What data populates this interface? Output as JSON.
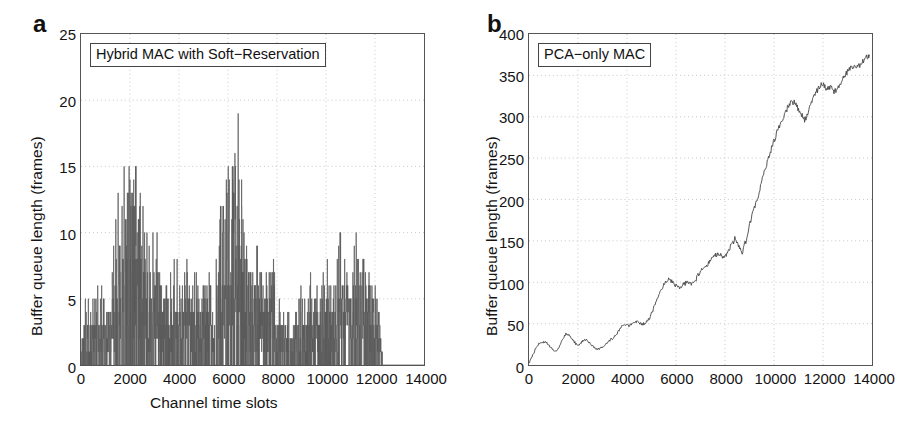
{
  "figure": {
    "panels": [
      {
        "letter": "a",
        "legend": "Hybrid MAC with Soft−Reservation",
        "xlabel": "Channel time slots",
        "ylabel": "Buffer queue length (frames)"
      },
      {
        "letter": "b",
        "legend": "PCA−only MAC",
        "xlabel": "Channel time slots",
        "ylabel": "Buffer queue length (frames)"
      }
    ]
  },
  "chart_data": [
    {
      "type": "line",
      "title": "",
      "legend_label": "Hybrid MAC with Soft−Reservation",
      "legend_position": "top-left",
      "xlabel": "Channel time slots",
      "ylabel": "Buffer queue length (frames)",
      "xlim": [
        0,
        14000
      ],
      "ylim": [
        0,
        25
      ],
      "xticks": [
        0,
        2000,
        4000,
        6000,
        8000,
        10000,
        12000,
        14000
      ],
      "yticks": [
        0,
        5,
        10,
        15,
        20,
        25
      ],
      "grid": true,
      "grid_style": "dotted",
      "line_color": "#5a5a5a",
      "description": "Dense high-frequency spiky queue-length trace that stays bounded; bursts of activity between 0 and about 12300 slots, then flat/no data.",
      "envelope_x": [
        0,
        200,
        400,
        600,
        800,
        1000,
        1200,
        1400,
        1600,
        1800,
        2000,
        2200,
        2400,
        2600,
        2800,
        3000,
        3200,
        3400,
        3600,
        3800,
        4000,
        4200,
        4400,
        4600,
        4800,
        5000,
        5200,
        5400,
        5600,
        5800,
        6000,
        6200,
        6400,
        6600,
        6800,
        7000,
        7200,
        7400,
        7600,
        7800,
        8000,
        8200,
        8400,
        8600,
        8800,
        9000,
        9200,
        9400,
        9600,
        9800,
        10000,
        10200,
        10400,
        10600,
        10800,
        11000,
        11200,
        11400,
        11600,
        11800,
        12000,
        12200,
        12400
      ],
      "envelope_max": [
        2,
        6,
        5,
        6,
        6,
        5,
        5,
        12,
        14,
        16,
        18,
        15,
        16,
        10,
        9,
        13,
        8,
        6,
        7,
        9,
        8,
        9,
        7,
        8,
        6,
        8,
        7,
        5,
        11,
        13,
        16,
        19,
        20,
        13,
        8,
        7,
        10,
        9,
        7,
        9,
        5,
        4,
        4,
        4,
        5,
        6,
        5,
        7,
        6,
        6,
        9,
        8,
        7,
        11,
        9,
        10,
        11,
        9,
        8,
        8,
        6,
        4,
        0
      ],
      "envelope_min": [
        0,
        0,
        0,
        0,
        0,
        0,
        0,
        0,
        0,
        0,
        0,
        0,
        0,
        0,
        0,
        0,
        0,
        0,
        0,
        0,
        0,
        0,
        0,
        0,
        0,
        0,
        0,
        0,
        0,
        0,
        0,
        0,
        0,
        0,
        0,
        0,
        0,
        0,
        0,
        0,
        0,
        0,
        0,
        0,
        0,
        0,
        0,
        0,
        0,
        0,
        0,
        0,
        0,
        0,
        0,
        0,
        0,
        0,
        0,
        0,
        0,
        0,
        0
      ],
      "peak_value": 20,
      "peak_x": 6400,
      "data_end_x": 12300
    },
    {
      "type": "line",
      "title": "",
      "legend_label": "PCA−only MAC",
      "legend_position": "top-left",
      "xlabel": "Channel time slots",
      "ylabel": "Buffer queue length (frames)",
      "xlim": [
        0,
        14000
      ],
      "ylim": [
        0,
        400
      ],
      "xticks": [
        0,
        2000,
        4000,
        6000,
        8000,
        10000,
        12000,
        14000
      ],
      "yticks": [
        0,
        50,
        100,
        150,
        200,
        250,
        300,
        350,
        400
      ],
      "grid": true,
      "grid_style": "dotted",
      "line_color": "#444444",
      "description": "Monotonically growing buffer queue with random-walk fluctuations, indicating instability; rises from 0 to about 375 frames by 13900 slots.",
      "x": [
        0,
        150,
        300,
        450,
        600,
        750,
        900,
        1050,
        1200,
        1350,
        1500,
        1650,
        1800,
        1950,
        2100,
        2250,
        2400,
        2550,
        2700,
        2850,
        3000,
        3150,
        3300,
        3450,
        3600,
        3750,
        3900,
        4050,
        4200,
        4350,
        4500,
        4650,
        4800,
        4950,
        5100,
        5250,
        5400,
        5550,
        5700,
        5850,
        6000,
        6150,
        6300,
        6450,
        6600,
        6750,
        6900,
        7050,
        7200,
        7350,
        7500,
        7650,
        7800,
        7950,
        8100,
        8250,
        8400,
        8550,
        8700,
        8850,
        9000,
        9150,
        9300,
        9450,
        9600,
        9750,
        9900,
        10050,
        10200,
        10350,
        10500,
        10650,
        10800,
        10950,
        11100,
        11250,
        11400,
        11550,
        11700,
        11850,
        12000,
        12150,
        12300,
        12450,
        12600,
        12750,
        12900,
        13050,
        13200,
        13350,
        13500,
        13650,
        13800,
        13900
      ],
      "y": [
        2,
        12,
        22,
        27,
        28,
        26,
        21,
        16,
        20,
        30,
        38,
        36,
        30,
        24,
        26,
        31,
        29,
        24,
        20,
        19,
        22,
        26,
        30,
        33,
        38,
        45,
        50,
        47,
        50,
        52,
        51,
        49,
        52,
        58,
        70,
        82,
        92,
        99,
        104,
        101,
        96,
        93,
        97,
        100,
        97,
        100,
        108,
        115,
        119,
        124,
        130,
        134,
        133,
        131,
        134,
        145,
        152,
        143,
        136,
        150,
        168,
        185,
        200,
        215,
        232,
        248,
        262,
        275,
        288,
        298,
        308,
        316,
        318,
        312,
        303,
        296,
        305,
        318,
        328,
        337,
        340,
        332,
        336,
        330,
        334,
        342,
        350,
        356,
        360,
        358,
        362,
        368,
        372,
        375
      ]
    }
  ]
}
